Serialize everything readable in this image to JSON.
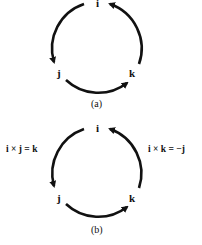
{
  "diagram": {
    "type": "cyclic-cross-product-mnemonic",
    "arrow_color": "#111111",
    "panels": [
      {
        "id": "a",
        "caption": "(a)",
        "nodes": {
          "top": "i",
          "bottom_left": "j",
          "bottom_right": "k"
        },
        "arrows": [
          {
            "from": "i",
            "to": "j"
          },
          {
            "from": "j",
            "to": "k"
          },
          {
            "from": "k",
            "to": "i"
          }
        ]
      },
      {
        "id": "b",
        "caption": "(b)",
        "nodes": {
          "top": "i",
          "bottom_left": "j",
          "bottom_right": "k"
        },
        "arrows": [
          {
            "from": "i",
            "to": "j"
          },
          {
            "from": "j",
            "to": "k"
          },
          {
            "from": "k",
            "to": "i"
          }
        ],
        "annotations": {
          "left": "i × j = k",
          "right": "i × k = −j"
        }
      }
    ]
  }
}
